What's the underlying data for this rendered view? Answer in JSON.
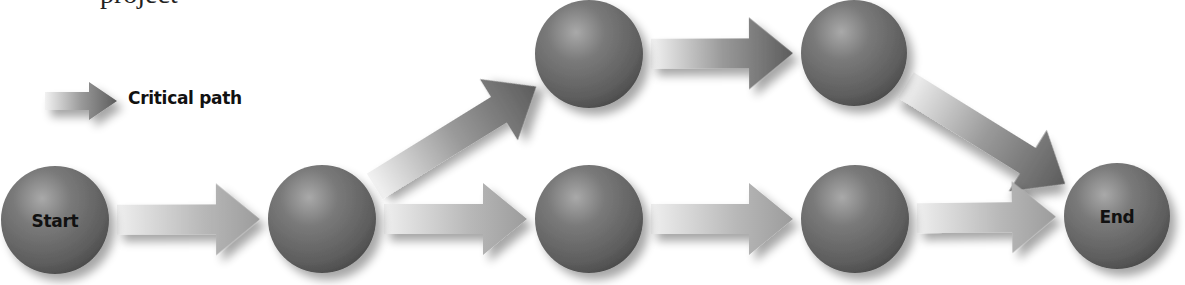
{
  "caption_cropped": "project",
  "legend": {
    "label": "Critical path",
    "icon": "critical-path-arrow-icon"
  },
  "colors": {
    "background": "#ffffff",
    "sphere_dark": "#4a4a4a",
    "sphere_mid": "#6e6e6e",
    "sphere_highlight": "#a9a9a9",
    "arrow_light": "#ededed",
    "arrow_normal_end": "#9c9c9c",
    "arrow_critical_end": "#5c5c5c",
    "text": "#111111"
  },
  "nodes": [
    {
      "id": "start",
      "label": "Start",
      "cx": 55,
      "cy": 220,
      "r": 54
    },
    {
      "id": "n2",
      "label": "",
      "cx": 322,
      "cy": 219,
      "r": 54
    },
    {
      "id": "top1",
      "label": "",
      "cx": 589,
      "cy": 54,
      "r": 54
    },
    {
      "id": "top2",
      "label": "",
      "cx": 854,
      "cy": 53,
      "r": 53
    },
    {
      "id": "b3",
      "label": "",
      "cx": 589,
      "cy": 219,
      "r": 54
    },
    {
      "id": "b4",
      "label": "",
      "cx": 855,
      "cy": 219,
      "r": 54
    },
    {
      "id": "end",
      "label": "End",
      "cx": 1117,
      "cy": 216,
      "r": 53
    }
  ],
  "edges": [
    {
      "from": "start",
      "to": "n2",
      "critical": false
    },
    {
      "from": "n2",
      "to": "top1",
      "critical": true
    },
    {
      "from": "top1",
      "to": "top2",
      "critical": true
    },
    {
      "from": "top2",
      "to": "end",
      "critical": true
    },
    {
      "from": "n2",
      "to": "b3",
      "critical": false
    },
    {
      "from": "b3",
      "to": "b4",
      "critical": false
    },
    {
      "from": "b4",
      "to": "end",
      "critical": false
    }
  ]
}
